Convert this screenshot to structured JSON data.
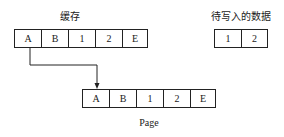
{
  "cache": {
    "label": "缓存",
    "cells": [
      "A",
      "B",
      "1",
      "2",
      "E"
    ]
  },
  "pending": {
    "label": "待写入的数据",
    "cells": [
      "1",
      "2"
    ]
  },
  "page": {
    "label": "Page",
    "cells": [
      "A",
      "B",
      "1",
      "2",
      "E"
    ]
  },
  "colors": {
    "line": "#222222",
    "background": "#ffffff"
  }
}
